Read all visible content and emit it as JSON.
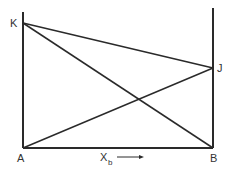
{
  "diagram": {
    "labels": {
      "K": "K",
      "J": "J",
      "A": "A",
      "B": "B",
      "x_axis_main": "X",
      "x_axis_sub": "b"
    },
    "line_color": "#2a2a2a",
    "text_color": "#333333",
    "segments": [
      {
        "from": "A",
        "to": "K",
        "description": "left vertical axis"
      },
      {
        "from": "B",
        "to": "J",
        "description": "right vertical axis"
      },
      {
        "from": "A",
        "to": "B",
        "description": "base line"
      },
      {
        "from": "K",
        "to": "J"
      },
      {
        "from": "K",
        "to": "B"
      },
      {
        "from": "A",
        "to": "J"
      }
    ]
  }
}
